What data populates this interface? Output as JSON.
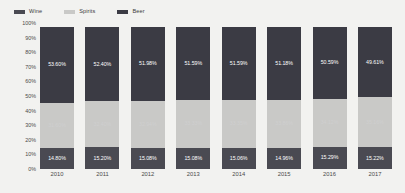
{
  "legend": {
    "position": "top-left",
    "items": [
      {
        "label": "Wine",
        "color": "#4a4a52",
        "icon": "legend-swatch-icon"
      },
      {
        "label": "Spirits",
        "color": "#c9c9c7",
        "icon": "legend-swatch-icon"
      },
      {
        "label": "Beer",
        "color": "#3b3b44",
        "icon": "legend-swatch-icon"
      }
    ]
  },
  "axis": {
    "y_ticks": [
      "100%",
      "90%",
      "80%",
      "70%",
      "60%",
      "50%",
      "40%",
      "30%",
      "20%",
      "10%",
      "0%"
    ],
    "x_ticks": [
      "2010",
      "2011",
      "2012",
      "2013",
      "2014",
      "2015",
      "2016",
      "2017"
    ]
  },
  "colors": {
    "background": "#f2f2f0",
    "beer": "#3b3b44",
    "spirits": "#c9c9c7",
    "wine": "#4a4a52",
    "label_text": "#4a4a4a"
  },
  "chart_data": {
    "type": "bar",
    "title": "",
    "subtitle": "",
    "xlabel": "",
    "ylabel": "",
    "ylim": [
      0,
      100
    ],
    "grid": false,
    "stacked": true,
    "stack_total": "100%",
    "legend_position": "top-left",
    "categories": [
      "2010",
      "2011",
      "2012",
      "2013",
      "2014",
      "2015",
      "2016",
      "2017"
    ],
    "series": [
      {
        "name": "Beer",
        "color": "#3b3b44",
        "values": [
          53.6,
          52.4,
          51.98,
          51.59,
          51.59,
          51.18,
          50.59,
          49.61
        ],
        "labels": [
          "53.60%",
          "52.40%",
          "51.98%",
          "51.59%",
          "51.59%",
          "51.18%",
          "50.59%",
          "49.61%"
        ]
      },
      {
        "name": "Spirits",
        "color": "#c9c9c7",
        "values": [
          31.6,
          32.4,
          32.94,
          33.33,
          33.35,
          33.86,
          34.12,
          35.16
        ],
        "labels": [
          "31.60%",
          "32.40%",
          "32.94%",
          "33.33%",
          "33.35%",
          "33.86%",
          "34.12%",
          "35.16%"
        ]
      },
      {
        "name": "Wine",
        "color": "#4a4a52",
        "values": [
          14.8,
          15.2,
          15.08,
          15.08,
          15.06,
          14.96,
          15.29,
          15.22
        ],
        "labels": [
          "14.80%",
          "15.20%",
          "15.08%",
          "15.08%",
          "15.06%",
          "14.96%",
          "15.29%",
          "15.22%"
        ]
      }
    ]
  }
}
